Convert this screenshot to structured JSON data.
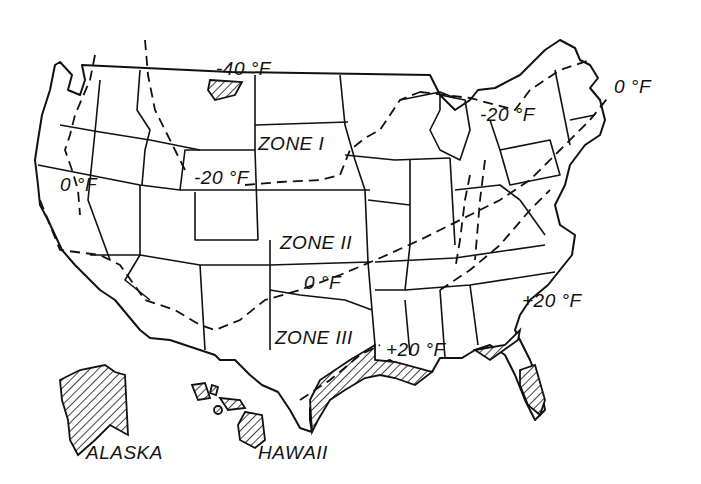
{
  "map": {
    "title": "",
    "zones": [
      {
        "label": "ZONE I"
      },
      {
        "label": "ZONE II"
      },
      {
        "label": "ZONE III"
      }
    ],
    "isotherms": [
      {
        "label": "-40 °F"
      },
      {
        "label": "-20 °F"
      },
      {
        "label": "-20 °F"
      },
      {
        "label": "0 °F"
      },
      {
        "label": "0 °F"
      },
      {
        "label": "0 °F"
      },
      {
        "label": "+20 °F"
      },
      {
        "label": "+20 °F"
      }
    ],
    "regions": [
      {
        "label": "ALASKA"
      },
      {
        "label": "HAWAII"
      }
    ],
    "colors": {
      "ink": "#111111",
      "background": "#ffffff"
    }
  }
}
